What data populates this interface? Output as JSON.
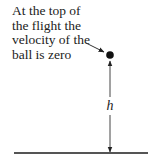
{
  "annotation": {
    "lines": [
      "At the top of",
      "the flight the",
      "velocity of the",
      "ball is zero"
    ]
  },
  "height_label": "h",
  "colors": {
    "ink": "#222222",
    "ground": "#555555"
  }
}
